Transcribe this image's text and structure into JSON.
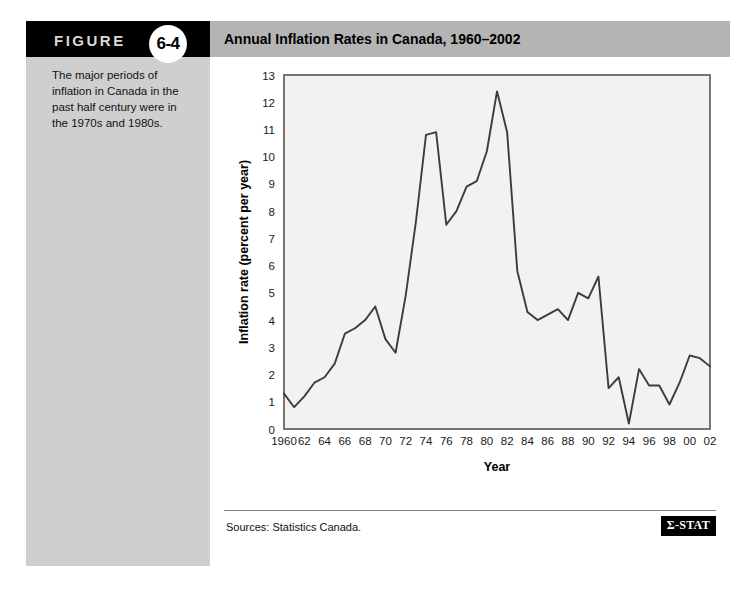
{
  "figure": {
    "label": "FIGURE",
    "number": "6-4",
    "caption": "The major periods of inflation in Canada in the past half century were in the 1970s and 1980s."
  },
  "header": {
    "title": "Annual Inflation Rates in Canada, 1960–2002"
  },
  "footer": {
    "source": "Sources: Statistics Canada.",
    "logo": "Σ-STAT"
  },
  "colors": {
    "badge_background": "#000000",
    "title_background": "#b4b4b4",
    "panel_background": "#cfcfcf",
    "plot_background": "#f2f2f2",
    "line": "#3c3c3c",
    "grid": "#ffffff",
    "axis": "#555555"
  },
  "chart_data": {
    "type": "line",
    "title": "Annual Inflation Rates in Canada, 1960–2002",
    "xlabel": "Year",
    "ylabel": "Inflation rate (percent per year)",
    "xlim": [
      1960,
      2002
    ],
    "ylim": [
      0,
      13
    ],
    "grid": true,
    "legend": "none",
    "ytick_labels": [
      "0",
      "1",
      "2",
      "3",
      "4",
      "5",
      "6",
      "7",
      "8",
      "9",
      "10",
      "11",
      "12",
      "13"
    ],
    "ytick_values": [
      0,
      1,
      2,
      3,
      4,
      5,
      6,
      7,
      8,
      9,
      10,
      11,
      12,
      13
    ],
    "xtick_labels": [
      "1960",
      "62",
      "64",
      "66",
      "68",
      "70",
      "72",
      "74",
      "76",
      "78",
      "80",
      "82",
      "84",
      "86",
      "88",
      "90",
      "92",
      "94",
      "96",
      "98",
      "00",
      "02"
    ],
    "xtick_values": [
      1960,
      1962,
      1964,
      1966,
      1968,
      1970,
      1972,
      1974,
      1976,
      1978,
      1980,
      1982,
      1984,
      1986,
      1988,
      1990,
      1992,
      1994,
      1996,
      1998,
      2000,
      2002
    ],
    "x": [
      1960,
      1961,
      1962,
      1963,
      1964,
      1965,
      1966,
      1967,
      1968,
      1969,
      1970,
      1971,
      1972,
      1973,
      1974,
      1975,
      1976,
      1977,
      1978,
      1979,
      1980,
      1981,
      1982,
      1983,
      1984,
      1985,
      1986,
      1987,
      1988,
      1989,
      1990,
      1991,
      1992,
      1993,
      1994,
      1995,
      1996,
      1997,
      1998,
      1999,
      2000,
      2001,
      2002
    ],
    "values": [
      1.3,
      0.8,
      1.2,
      1.7,
      1.9,
      2.4,
      3.5,
      3.7,
      4.0,
      4.5,
      3.3,
      2.8,
      4.9,
      7.6,
      10.8,
      10.9,
      7.5,
      8.0,
      8.9,
      9.1,
      10.2,
      12.4,
      10.9,
      5.8,
      4.3,
      4.0,
      4.2,
      4.4,
      4.0,
      5.0,
      4.8,
      5.6,
      1.5,
      1.9,
      0.2,
      2.2,
      1.6,
      1.6,
      0.9,
      1.7,
      2.7,
      2.6,
      2.3
    ],
    "series_name": "Inflation rate"
  }
}
